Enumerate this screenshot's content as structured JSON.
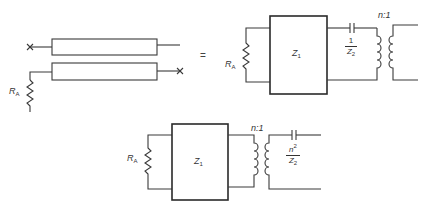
{
  "diagram": {
    "type": "equivalent-circuit",
    "equals_sign": "=",
    "left": {
      "description": "Two coaxial line sections with source resistor",
      "resistor_label": "R",
      "resistor_sub": "A",
      "open_mark": "×"
    },
    "right_top": {
      "resistor_label": "R",
      "resistor_sub": "A",
      "box_label": "Z",
      "box_sub": "1",
      "cap_num": "1",
      "cap_den_main": "Z",
      "cap_den_sub": "2",
      "ratio": "n:1"
    },
    "bottom": {
      "resistor_label": "R",
      "resistor_sub": "A",
      "box_label": "Z",
      "box_sub": "1",
      "ratio": "n:1",
      "cap_num_main": "n",
      "cap_num_sup": "2",
      "cap_den_main": "Z",
      "cap_den_sub": "2"
    },
    "colors": {
      "line": "#3a3a3a",
      "background": "#ffffff"
    }
  }
}
